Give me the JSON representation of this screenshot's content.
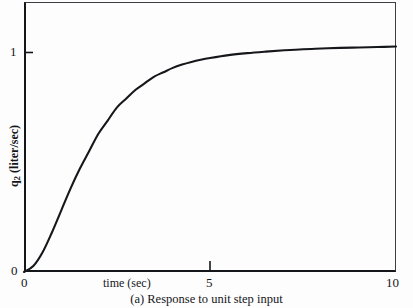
{
  "figure": {
    "caption": "(a) Response to unit step input"
  },
  "axes": {
    "x_title": "time (sec)",
    "y_title_main": "q",
    "y_title_sub": "2",
    "y_title_rest": " (liter/sec)",
    "y_title_full": "q2 (liter/sec)"
  },
  "chart_data": {
    "type": "line",
    "title": "(a) Response to unit step input",
    "xlabel": "time (sec)",
    "ylabel": "q2 (liter/sec)",
    "xlim": [
      0,
      10
    ],
    "ylim": [
      0,
      1.23
    ],
    "grid": false,
    "legend": null,
    "xticks": [
      0,
      5,
      10
    ],
    "xtick_labels": [
      "0",
      "5",
      "10"
    ],
    "yticks": [
      0,
      1
    ],
    "ytick_labels": [
      "0",
      "1"
    ],
    "series": [
      {
        "name": "q2 step response",
        "color": "#16171b",
        "x": [
          0,
          0.25,
          0.5,
          0.75,
          1.0,
          1.25,
          1.5,
          1.75,
          2.0,
          2.25,
          2.5,
          2.75,
          3.0,
          3.25,
          3.5,
          3.75,
          4.0,
          4.25,
          4.5,
          4.75,
          5.0,
          5.5,
          6.0,
          6.5,
          7.0,
          7.5,
          8.0,
          8.5,
          9.0,
          9.5,
          10.0
        ],
        "y": [
          0.0,
          0.027,
          0.09,
          0.18,
          0.28,
          0.38,
          0.47,
          0.55,
          0.63,
          0.69,
          0.75,
          0.79,
          0.83,
          0.86,
          0.89,
          0.91,
          0.93,
          0.945,
          0.957,
          0.967,
          0.975,
          0.988,
          0.997,
          1.004,
          1.01,
          1.015,
          1.018,
          1.021,
          1.023,
          1.025,
          1.027
        ]
      }
    ],
    "annotations": []
  }
}
